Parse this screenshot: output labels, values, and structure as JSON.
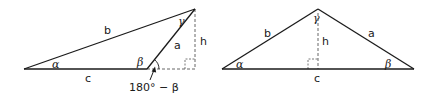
{
  "colors": {
    "background": "#ffffff",
    "stroke": "#1a1a1a",
    "dashed": "#555555"
  },
  "figure_left": {
    "description": "Obtuse triangle with altitude h drawn outside to extended base",
    "vertices": {
      "A": [
        24,
        69
      ],
      "B": [
        147,
        69
      ],
      "C": [
        195,
        9
      ]
    },
    "foot_of_altitude": [
      195,
      69
    ],
    "labels": {
      "side_b": "b",
      "side_a": "a",
      "side_c": "c",
      "height": "h",
      "angle_alpha": "α",
      "angle_beta": "β",
      "angle_gamma": "γ",
      "exterior_angle": "180° − β"
    }
  },
  "figure_right": {
    "description": "Acute triangle with altitude h drawn to base c",
    "vertices": {
      "A": [
        222,
        69
      ],
      "B": [
        414,
        69
      ],
      "C": [
        318,
        9
      ]
    },
    "foot_of_altitude": [
      318,
      69
    ],
    "labels": {
      "side_b": "b",
      "side_a": "a",
      "side_c": "c",
      "height": "h",
      "angle_alpha": "α",
      "angle_beta": "β",
      "angle_gamma": "γ"
    }
  }
}
